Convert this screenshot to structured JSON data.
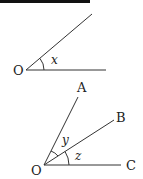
{
  "figure1": {
    "vertex_label": "O",
    "angle_label": "x"
  },
  "figure2": {
    "vertex_label": "O",
    "ray_labels": [
      "A",
      "B",
      "C"
    ],
    "angle_labels": [
      "y",
      "z"
    ]
  },
  "colors": {
    "line": "#333333",
    "text": "#222222",
    "top_bar": "#111111"
  }
}
